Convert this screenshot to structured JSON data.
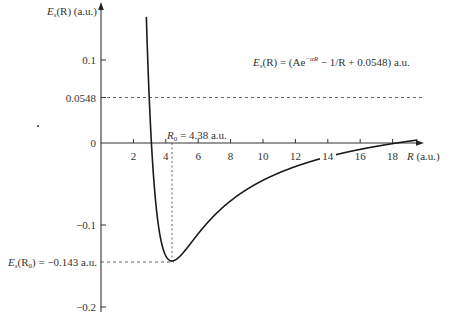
{
  "chart_data": {
    "type": "line",
    "title": "",
    "equation": {
      "lhs": "E",
      "lhs_sub": "s",
      "lhs_arg": "(R) = (Ae",
      "exp": "−αR",
      "rhs": " − 1/R + 0.0548) a.u."
    },
    "ylabel": {
      "main": "E",
      "sub": "s",
      "rest": "(R) (a.u.)"
    },
    "xlabel": {
      "main": "R",
      "rest": " (a.u.)"
    },
    "xlim": [
      0,
      19.5
    ],
    "ylim": [
      -0.2,
      0.17
    ],
    "x_ticks": [
      "2",
      "4",
      "6",
      "8",
      "10",
      "12",
      "14",
      "16",
      "18"
    ],
    "y_ticks": [
      {
        "value": 0.1,
        "label": "0.1"
      },
      {
        "value": 0.0548,
        "label": "0.0548"
      },
      {
        "value": 0,
        "label": "0"
      },
      {
        "value": -0.1,
        "label": "−0.1"
      },
      {
        "value": -0.2,
        "label": "−0.2"
      }
    ],
    "parameters": {
      "A": 54.4,
      "alpha": 1.709,
      "offset": 0.0548
    },
    "annotations": {
      "r0_label": {
        "main": "R",
        "sub": "0",
        "rest": " = 4.38 a.u."
      },
      "min_label": {
        "main": "E",
        "sub": "s",
        "arg": "(R",
        "arg_sub": "0",
        "rest": ") = −0.143 a.u."
      },
      "R0": 4.38,
      "E_min": -0.143,
      "asymptote": 0.0548
    },
    "series": [
      {
        "name": "E_s(R)",
        "x": [
          2.78,
          2.9,
          3.0,
          3.1,
          3.25,
          3.4,
          3.6,
          3.8,
          4.0,
          4.2,
          4.38,
          4.6,
          4.9,
          5.2,
          5.6,
          6.0,
          6.5,
          7.0,
          8.0,
          9.0,
          10.0,
          11.0,
          12.0,
          13.0,
          14.0,
          15.0,
          16.0,
          17.0,
          18.0,
          19.5
        ],
        "values": [
          0.166,
          0.104,
          0.06,
          0.004,
          -0.035,
          -0.072,
          -0.104,
          -0.125,
          -0.137,
          -0.142,
          -0.143,
          -0.14,
          -0.132,
          -0.122,
          -0.109,
          -0.097,
          -0.085,
          -0.074,
          -0.07,
          -0.056,
          -0.045,
          -0.036,
          -0.029,
          -0.022,
          -0.017,
          -0.012,
          -0.008,
          -0.004,
          -0.001,
          0.004
        ]
      }
    ],
    "grid": false,
    "legend": "none"
  }
}
